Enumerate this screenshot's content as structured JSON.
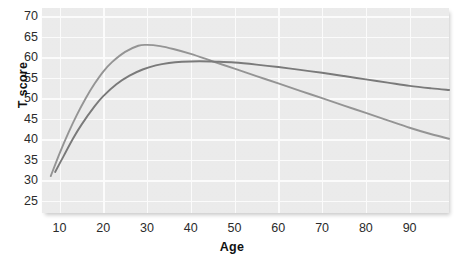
{
  "chart_data": {
    "type": "line",
    "title": "",
    "xlabel": "Age",
    "ylabel": "T score",
    "xlim": [
      6,
      99
    ],
    "ylim": [
      22,
      72
    ],
    "xticks": [
      10,
      20,
      30,
      40,
      50,
      60,
      70,
      80,
      90
    ],
    "yticks": [
      25,
      30,
      35,
      40,
      45,
      50,
      55,
      60,
      65,
      70
    ],
    "grid": true,
    "legend": "none",
    "series": [
      {
        "name": "curve-light",
        "color": "#8a8a8a",
        "x": [
          8,
          10,
          12,
          14,
          16,
          18,
          20,
          22,
          25,
          28,
          30,
          33,
          36,
          40,
          45,
          50,
          55,
          60,
          65,
          70,
          75,
          80,
          85,
          90,
          95,
          99
        ],
        "y": [
          31.0,
          36.5,
          41.5,
          46.0,
          50.0,
          53.5,
          56.5,
          58.8,
          61.3,
          62.8,
          63.0,
          62.7,
          62.0,
          60.8,
          59.0,
          57.2,
          55.4,
          53.6,
          51.8,
          50.0,
          48.2,
          46.4,
          44.6,
          42.8,
          41.2,
          40.1
        ]
      },
      {
        "name": "curve-dark",
        "color": "#6d6d6d",
        "x": [
          9,
          11,
          13,
          15,
          18,
          20,
          23,
          26,
          29,
          32,
          35,
          38,
          42,
          46,
          50,
          55,
          60,
          65,
          70,
          75,
          80,
          85,
          90,
          95,
          99
        ],
        "y": [
          32.0,
          36.0,
          40.0,
          43.5,
          48.0,
          50.5,
          53.4,
          55.5,
          57.0,
          58.0,
          58.6,
          58.9,
          59.0,
          58.9,
          58.7,
          58.2,
          57.6,
          56.9,
          56.2,
          55.4,
          54.6,
          53.8,
          53.0,
          52.4,
          52.0
        ]
      }
    ]
  }
}
